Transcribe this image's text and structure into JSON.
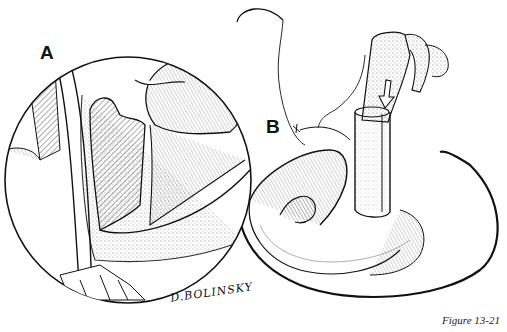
{
  "figure": {
    "caption": "Figure 13-21",
    "labels": {
      "a": "A",
      "b": "B"
    },
    "signature": "D.BOLINSKY",
    "inset_description": "magnified circular inset of anatomy",
    "main_description": "curved tissue with a tubular graft and an arrow showing direction of insertion",
    "arrow_icon": "down-arrow-icon"
  }
}
